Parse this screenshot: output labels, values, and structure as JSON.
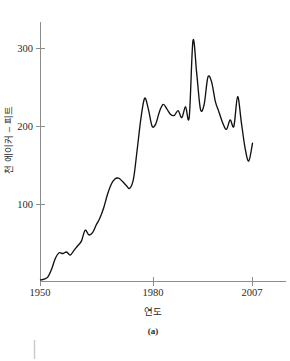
{
  "figure": {
    "subfigure_label": "(a)",
    "background_color": "#ffffff",
    "line_color": "#111111",
    "axis_color": "#8d8d8d"
  },
  "chart_data": {
    "type": "line",
    "title": "",
    "xlabel": "연도",
    "ylabel": "천 에이커 – 피트",
    "xlim": [
      1950,
      2009
    ],
    "ylim": [
      0,
      330
    ],
    "grid": false,
    "legend": null,
    "x_tick_labels": [
      "1950",
      "1980",
      "2007"
    ],
    "x_tick_values": [
      1950,
      1980,
      2007
    ],
    "y_tick_labels": [
      "100",
      "200",
      "300"
    ],
    "y_tick_values": [
      100,
      200,
      300
    ],
    "series": [
      {
        "name": "천 에이커 – 피트",
        "x": [
          1950,
          1951,
          1952,
          1953,
          1954,
          1955,
          1956,
          1957,
          1958,
          1959,
          1960,
          1961,
          1962,
          1963,
          1964,
          1965,
          1966,
          1967,
          1968,
          1969,
          1970,
          1971,
          1972,
          1973,
          1974,
          1975,
          1976,
          1977,
          1978,
          1979,
          1980,
          1981,
          1982,
          1983,
          1984,
          1985,
          1986,
          1987,
          1988,
          1989,
          1990,
          1991,
          1992,
          1993,
          1994,
          1995,
          1996,
          1997,
          1998,
          1999,
          2000,
          2001,
          2002,
          2003,
          2004,
          2005,
          2006,
          2007
        ],
        "values": [
          2,
          3,
          6,
          16,
          30,
          37,
          36,
          38,
          34,
          40,
          46,
          52,
          66,
          60,
          63,
          73,
          82,
          95,
          112,
          125,
          132,
          133,
          129,
          124,
          120,
          132,
          170,
          210,
          236,
          222,
          200,
          203,
          219,
          228,
          222,
          215,
          214,
          220,
          211,
          225,
          212,
          310,
          268,
          222,
          228,
          263,
          257,
          232,
          218,
          204,
          196,
          208,
          200,
          238,
          205,
          172,
          155,
          178
        ]
      }
    ]
  }
}
